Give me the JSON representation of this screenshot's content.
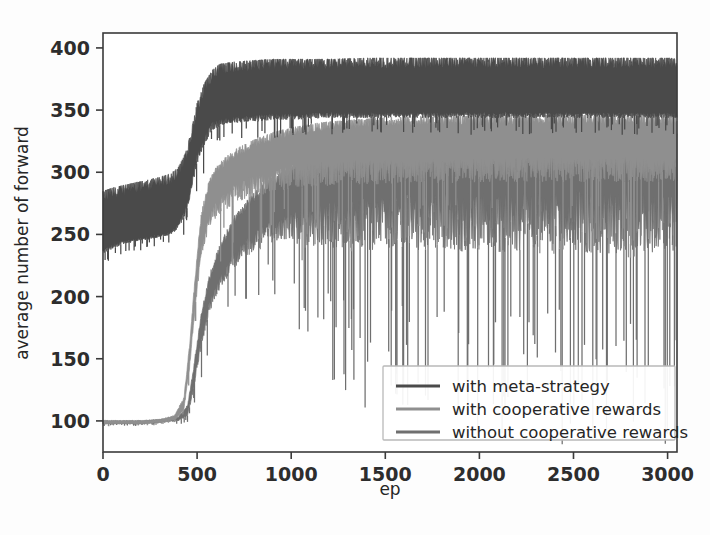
{
  "chart_data": {
    "type": "line",
    "title": "",
    "xlabel": "ep",
    "ylabel": "average number of forward",
    "xlim": [
      0,
      3050
    ],
    "ylim": [
      75,
      412
    ],
    "xticks": [
      0,
      500,
      1000,
      1500,
      2000,
      2500,
      3000
    ],
    "xtick_labels": [
      "0",
      "500",
      "1000",
      "1500",
      "2000",
      "2500",
      "3000"
    ],
    "yticks": [
      100,
      150,
      200,
      250,
      300,
      350,
      400
    ],
    "ytick_labels": [
      "100",
      "150",
      "200",
      "250",
      "300",
      "350",
      "400"
    ],
    "grid": false,
    "legend_position": "lower right",
    "series": [
      {
        "name": "with meta-strategy",
        "color": "#4a4a4a",
        "noise_color": "#4a4a4a",
        "x": [
          0,
          60,
          120,
          180,
          240,
          300,
          360,
          400,
          440,
          470,
          500,
          540,
          580,
          620,
          700,
          800,
          900,
          1000,
          1200,
          1400,
          1600,
          1800,
          2000,
          2200,
          2400,
          2600,
          2800,
          3000
        ],
        "values": [
          281,
          284,
          286,
          288,
          290,
          292,
          295,
          300,
          312,
          330,
          352,
          368,
          378,
          383,
          385,
          386,
          387,
          387,
          387,
          388,
          388,
          388,
          388,
          388,
          388,
          388,
          388,
          388
        ],
        "band_low": [
          238,
          243,
          245,
          247,
          248,
          250,
          252,
          258,
          272,
          290,
          315,
          330,
          340,
          343,
          345,
          346,
          347,
          347,
          348,
          348,
          348,
          348,
          348,
          348,
          348,
          348,
          348,
          348
        ],
        "spike_low": [
          232,
          236,
          240,
          242,
          244,
          246,
          248,
          252,
          262,
          278,
          300,
          316,
          328,
          332,
          335,
          336,
          338,
          338,
          340,
          340,
          340,
          340,
          340,
          340,
          340,
          340,
          340,
          340
        ]
      },
      {
        "name": "with cooperative rewards",
        "color": "#8f8f8f",
        "noise_color": "#8f8f8f",
        "x": [
          0,
          100,
          200,
          300,
          380,
          430,
          460,
          490,
          520,
          560,
          600,
          660,
          720,
          800,
          900,
          1000,
          1150,
          1300,
          1500,
          1700,
          1900,
          2100,
          2300,
          2500,
          2700,
          2900,
          3000
        ],
        "values": [
          100,
          100,
          100,
          101,
          104,
          118,
          160,
          215,
          262,
          288,
          300,
          310,
          316,
          322,
          328,
          332,
          336,
          338,
          340,
          341,
          341,
          342,
          342,
          342,
          342,
          342,
          342
        ],
        "band_low": [
          98,
          98,
          98,
          99,
          101,
          110,
          146,
          196,
          240,
          264,
          276,
          286,
          292,
          298,
          302,
          306,
          308,
          310,
          310,
          311,
          311,
          312,
          312,
          312,
          312,
          312,
          312
        ],
        "spike_low": [
          97,
          97,
          97,
          98,
          100,
          106,
          138,
          185,
          224,
          244,
          252,
          258,
          262,
          265,
          268,
          272,
          272,
          274,
          274,
          275,
          275,
          276,
          276,
          276,
          276,
          276,
          276
        ]
      },
      {
        "name": "without cooperative rewards",
        "color": "#6f6f6f",
        "noise_color": "#6f6f6f",
        "x": [
          0,
          100,
          200,
          300,
          400,
          450,
          480,
          520,
          560,
          620,
          700,
          780,
          860,
          950,
          1050,
          1150,
          1300,
          1450,
          1600,
          1800,
          2000,
          2200,
          2400,
          2600,
          2800,
          3000
        ],
        "values": [
          100,
          100,
          100,
          101,
          103,
          112,
          140,
          182,
          212,
          238,
          262,
          276,
          288,
          296,
          304,
          310,
          316,
          320,
          322,
          324,
          325,
          326,
          326,
          327,
          327,
          327
        ],
        "band_low": [
          98,
          98,
          98,
          99,
          101,
          106,
          128,
          166,
          194,
          216,
          238,
          250,
          258,
          264,
          270,
          274,
          278,
          280,
          282,
          283,
          284,
          284,
          285,
          285,
          285,
          285
        ],
        "spike_low": [
          97,
          97,
          97,
          98,
          99,
          102,
          118,
          150,
          176,
          196,
          212,
          222,
          228,
          232,
          218,
          212,
          206,
          202,
          200,
          198,
          196,
          196,
          194,
          194,
          193,
          193
        ]
      }
    ]
  },
  "legend": {
    "entries": [
      {
        "label": "with meta-strategy",
        "color": "#4a4a4a"
      },
      {
        "label": "with cooperative rewards",
        "color": "#8f8f8f"
      },
      {
        "label": "without cooperative rewards",
        "color": "#6f6f6f"
      }
    ]
  },
  "axes": {
    "xlabel": "ep",
    "ylabel": "average number of forward"
  }
}
